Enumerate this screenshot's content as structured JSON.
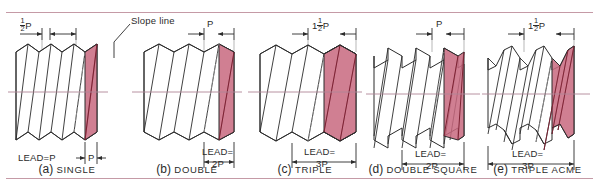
{
  "figure": {
    "title_note": "Slope line",
    "thread_fill_color": "#c8697f",
    "line_color": "#2b2b2b",
    "centerline_color": "#b08796",
    "rule_color": "#c59aa6"
  },
  "panels": [
    {
      "id": "single",
      "letter": "(a)",
      "name": "SINGLE",
      "top_dim": {
        "whole": "",
        "num": "1",
        "den": "2",
        "suffix": "P"
      },
      "lead_label": "LEAD=P",
      "bottom_dim": "P",
      "annotation": "Slope line"
    },
    {
      "id": "double",
      "letter": "(b)",
      "name": "DOUBLE",
      "top_dim": {
        "whole": "P",
        "num": "",
        "den": "",
        "suffix": ""
      },
      "lead_label": "LEAD=",
      "bottom_dim": "2P"
    },
    {
      "id": "triple",
      "letter": "(c)",
      "name": "TRIPLE",
      "top_dim": {
        "whole": "1",
        "num": "1",
        "den": "2",
        "suffix": "P"
      },
      "lead_label": "LEAD=",
      "bottom_dim": "3P"
    },
    {
      "id": "double-square",
      "letter": "(d)",
      "name": "DOUBLE SQUARE",
      "top_dim": {
        "whole": "P",
        "num": "",
        "den": "",
        "suffix": ""
      },
      "lead_label": "LEAD=",
      "bottom_dim": "2P"
    },
    {
      "id": "triple-acme",
      "letter": "(e)",
      "name": "TRIPLE ACME",
      "top_dim": {
        "whole": "1",
        "num": "1",
        "den": "2",
        "suffix": "P"
      },
      "lead_label": "LEAD=",
      "bottom_dim": "3P"
    }
  ]
}
